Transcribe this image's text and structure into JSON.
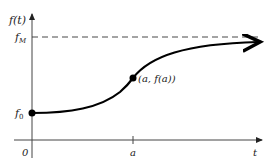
{
  "diagram": {
    "y_axis_label": "f(t)",
    "x_axis_label": "t",
    "upper_asymptote_label": "f",
    "upper_asymptote_sub": "M",
    "initial_value_label": "f",
    "initial_value_sub": "0",
    "origin_label": "0",
    "tick_label_a": "a",
    "point_label": "(a, f(a))",
    "curve_color": "#000000",
    "axis_color": "#333333"
  }
}
